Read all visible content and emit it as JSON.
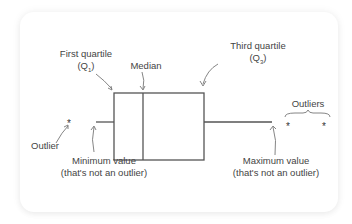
{
  "diagram": {
    "type": "box-plot-anatomy",
    "labels": {
      "first_quartile": "First quartile",
      "first_quartile_symbol": "(Q",
      "first_quartile_sub": "1",
      "first_quartile_close": ")",
      "median": "Median",
      "third_quartile": "Third quartile",
      "third_quartile_symbol": "(Q",
      "third_quartile_sub": "3",
      "third_quartile_close": ")",
      "outlier": "Outlier",
      "outliers": "Outliers",
      "minimum_line1": "Minimum value",
      "minimum_line2": "(that's not an outlier)",
      "maximum_line1": "Maximum value",
      "maximum_line2": "(that's not an outlier)"
    },
    "outlier_marker": "*",
    "colors": {
      "stroke": "#555555",
      "text": "#444444",
      "arrow": "#777777",
      "background": "#ffffff"
    }
  }
}
